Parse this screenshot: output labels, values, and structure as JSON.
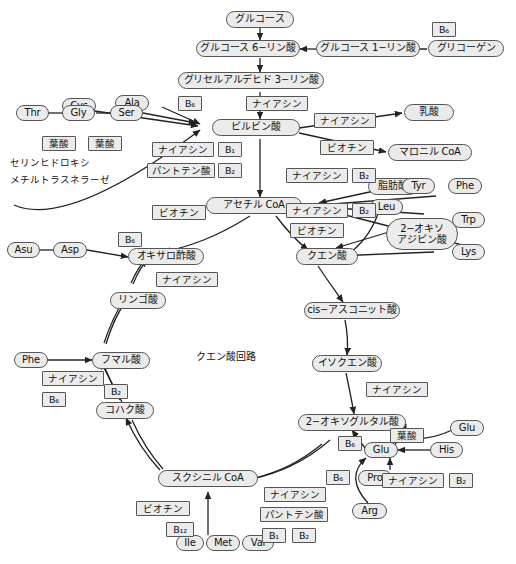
{
  "diagram": {
    "title": "クエン酸回路",
    "center_label": "クエン酸回路",
    "enzyme_note_line1": "セリンヒドロキシ",
    "enzyme_note_line2": "メチルトラスネラーゼ",
    "colors": {
      "node_fill": "#ebebeb",
      "node_stroke": "#555555",
      "arrow": "#222222",
      "background": "#ffffff"
    }
  },
  "metabolites": {
    "glucose": "グルコース",
    "glucose_6_phosphate": "グルコース 6−リン酸",
    "glucose_1_phosphate": "グルコース 1−リン酸",
    "glycogen": "グリコーゲン",
    "glyceraldehyde_3_phosphate": "グリセルアルデヒド 3−リン酸",
    "pyruvate": "ピルビン酸",
    "acetyl_coa": "アセチル CoA",
    "lactate": "乳酸",
    "malonyl_coa": "マロニル CoA",
    "fatty_acid": "脂肪酸",
    "oxoadipate_line1": "2−オキソ",
    "oxoadipate_line2": "アジピン酸",
    "oxaloacetate": "オキサロ酢酸",
    "citrate": "クエン酸",
    "cis_aconitate": "cis−アスコニット酸",
    "isocitrate": "イソクエン酸",
    "oxoglutarate": "2−オキソグルタル酸",
    "succinyl_coa": "スクシニル CoA",
    "succinate": "コハク酸",
    "fumarate": "フマル酸",
    "malate": "リンゴ酸"
  },
  "amino_acids": {
    "cys": "Cys",
    "ala": "Ala",
    "thr": "Thr",
    "gly": "Gly",
    "ser": "Ser",
    "asu": "Asu",
    "asp": "Asp",
    "phe_top": "Phe",
    "tyr": "Tyr",
    "trp": "Trp",
    "lys": "Lys",
    "leu": "Leu",
    "phe_left": "Phe",
    "glu_upper": "Glu",
    "glu_lower": "Glu",
    "his": "His",
    "pro": "Pro",
    "arg": "Arg",
    "ile": "Ile",
    "met": "Met",
    "val": "Val"
  },
  "vitamins": {
    "b6_glycogen": "B₆",
    "b6_glyceraldehyde": "B₆",
    "niacin_g3p": "ナイアシン",
    "niacin_pyr_right": "ナイアシン",
    "biotin_pyr_right": "ビオチン",
    "niacin_pyr_left": "ナイアシン",
    "b1_pyr": "B₁",
    "pantothenic_pyr": "パントテン酸",
    "b2_pyr": "B₂",
    "niacin_fa": "ナイアシン",
    "b2_fa": "B₂",
    "niacin_leu": "ナイアシン",
    "b2_leu": "B₂",
    "biotin_leu": "ビオチン",
    "biotin_oaa": "ビオチン",
    "b6_asp": "B₆",
    "niacin_mal": "ナイアシン",
    "folate_gly": "葉酸",
    "folate_ser": "葉酸",
    "niacin_phe": "ナイアシン",
    "b6_phe": "B₆",
    "b2_succ": "B₂",
    "niacin_iso": "ナイアシン",
    "b6_og": "B₆",
    "folate_his": "葉酸",
    "niacin_pro": "ナイアシン",
    "b2_pro": "B₂",
    "b6_arg": "B₆",
    "biotin_scoa": "ビオチン",
    "b12_scoa": "B₁₂",
    "niacin_scoa": "ナイアシン",
    "pantothenic_scoa": "パントテン酸",
    "b1_scoa": "B₁",
    "b2_scoa": "B₂"
  }
}
